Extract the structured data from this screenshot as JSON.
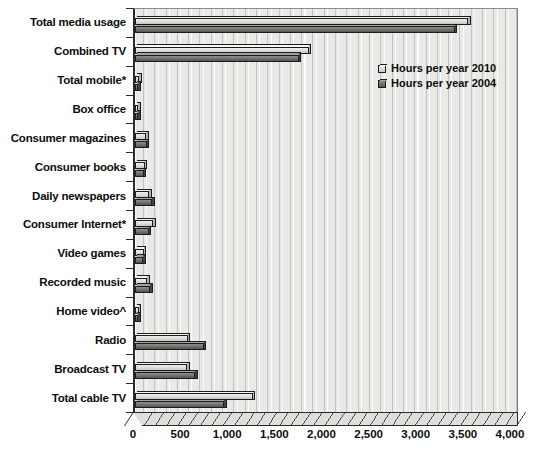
{
  "chart_data": {
    "type": "bar",
    "orientation": "horizontal",
    "title": "",
    "xlabel": "",
    "ylabel": "",
    "xlim": [
      0,
      4000
    ],
    "xticks": [
      "0",
      "500",
      "1,000",
      "1,500",
      "2,000",
      "2,500",
      "3,000",
      "3,500",
      "4,000"
    ],
    "xtick_values": [
      0,
      500,
      1000,
      1500,
      2000,
      2500,
      3000,
      3500,
      4000
    ],
    "grid": true,
    "legend_position": "top-right",
    "categories": [
      "Total media usage",
      "Combined TV",
      "Total mobile*",
      "Box office",
      "Consumer magazines",
      "Consumer books",
      "Daily newspapers",
      "Consumer Internet*",
      "Video games",
      "Recorded music",
      "Home video^",
      "Radio",
      "Broadcast TV",
      "Total cable TV"
    ],
    "series": [
      {
        "name": "Hours per year 2010",
        "values": [
          3535,
          1845,
          45,
          15,
          120,
          105,
          150,
          195,
          95,
          130,
          40,
          560,
          555,
          1250
        ]
      },
      {
        "name": "Hours per year 2004",
        "values": [
          3390,
          1740,
          10,
          12,
          125,
          95,
          185,
          145,
          85,
          160,
          25,
          730,
          640,
          945
        ]
      }
    ],
    "footnotes": [
      "* Total mobile and Consumer Internet",
      "^ Home video"
    ]
  },
  "legend": {
    "items": [
      {
        "label": "Hours per year 2010",
        "swatch": "light-gray"
      },
      {
        "label": "Hours per year 2004",
        "swatch": "dark-gray"
      }
    ]
  },
  "footnote_text": ""
}
